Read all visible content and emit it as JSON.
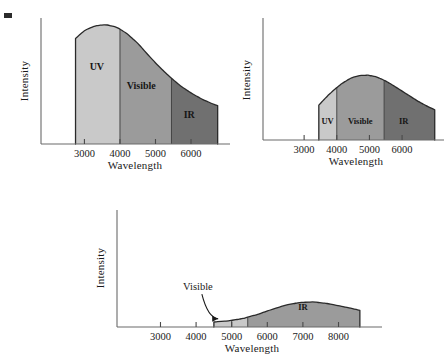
{
  "figure": {
    "corner_mark": "black-square-mark",
    "panel_count": 3
  },
  "bands": {
    "uv": {
      "label": "UV",
      "color": "#c9c9c9"
    },
    "visible": {
      "label": "Visible",
      "color": "#9b9b9b"
    },
    "ir": {
      "label": "IR",
      "color": "#707070"
    }
  },
  "chart_data": [
    {
      "id": "panel-hot-star",
      "type": "area",
      "title": "",
      "xlabel": "Wavelength",
      "ylabel": "Intensity",
      "xticks": [
        3000,
        4000,
        5000,
        6000
      ],
      "xticklabels": [
        "3000",
        "4000",
        "5000",
        "6000"
      ],
      "xlim": [
        2200,
        6900
      ],
      "ylim": [
        0,
        1.05
      ],
      "grid": false,
      "legend": "none",
      "peak_wavelength": 3600,
      "band_edges": {
        "uv_start": 2750,
        "uv_visible": 4000,
        "visible_ir": 5450,
        "ir_end": 6750
      },
      "band_labels": [
        {
          "text": "UV",
          "x": 3350,
          "y": 0.62
        },
        {
          "text": "Visible",
          "x": 4600,
          "y": 0.46
        },
        {
          "text": "IR",
          "x": 5950,
          "y": 0.22
        }
      ],
      "x": [
        2750,
        3000,
        3300,
        3600,
        3900,
        4200,
        4500,
        4800,
        5100,
        5400,
        5700,
        6000,
        6300,
        6600,
        6750
      ],
      "y": [
        0.88,
        0.945,
        0.985,
        0.995,
        0.975,
        0.92,
        0.84,
        0.74,
        0.645,
        0.56,
        0.485,
        0.425,
        0.375,
        0.335,
        0.32
      ]
    },
    {
      "id": "panel-medium-star",
      "type": "area",
      "title": "",
      "xlabel": "Wavelength",
      "ylabel": "Intensity",
      "xticks": [
        3000,
        4000,
        5000,
        6000
      ],
      "xticklabels": [
        "3000",
        "4000",
        "5000",
        "6000"
      ],
      "xlim": [
        2200,
        7100
      ],
      "ylim": [
        0,
        1.05
      ],
      "grid": false,
      "legend": "none",
      "peak_wavelength": 4800,
      "band_edges": {
        "uv_start": 3450,
        "uv_visible": 4000,
        "visible_ir": 5450,
        "ir_end": 7000
      },
      "band_labels": [
        {
          "text": "UV",
          "x": 3720,
          "y": 0.14
        },
        {
          "text": "Visible",
          "x": 4720,
          "y": 0.14
        },
        {
          "text": "IR",
          "x": 6050,
          "y": 0.14
        }
      ],
      "x": [
        3450,
        3700,
        3950,
        4200,
        4450,
        4700,
        4950,
        5200,
        5450,
        5700,
        5950,
        6200,
        6450,
        6700,
        7000
      ],
      "y": [
        0.3,
        0.375,
        0.44,
        0.495,
        0.535,
        0.555,
        0.558,
        0.545,
        0.515,
        0.475,
        0.43,
        0.385,
        0.34,
        0.3,
        0.26
      ]
    },
    {
      "id": "panel-cool-star",
      "type": "area",
      "title": "",
      "xlabel": "Wavelength",
      "ylabel": "Intensity",
      "xticks": [
        3000,
        4000,
        5000,
        6000,
        7000,
        8000
      ],
      "xticklabels": [
        "3000",
        "4000",
        "5000",
        "6000",
        "7000",
        "8000"
      ],
      "xlim": [
        2200,
        8800
      ],
      "ylim": [
        0,
        1.05
      ],
      "grid": false,
      "legend": "none",
      "peak_wavelength": 7000,
      "band_edges": {
        "visible_start": 4500,
        "visible_ir": 5450,
        "ir_end": 8600
      },
      "band_labels": [
        {
          "text": "IR",
          "x": 7000,
          "y": 0.155
        }
      ],
      "annotations": [
        {
          "text": "Visible",
          "x": 4050,
          "y": 0.33,
          "arrow_to_x": 4620,
          "arrow_to_y": 0.055
        }
      ],
      "x": [
        4500,
        4900,
        5300,
        5700,
        6100,
        6500,
        6900,
        7300,
        7700,
        8100,
        8600
      ],
      "y": [
        0.045,
        0.055,
        0.075,
        0.11,
        0.155,
        0.195,
        0.22,
        0.225,
        0.21,
        0.185,
        0.15
      ]
    }
  ]
}
